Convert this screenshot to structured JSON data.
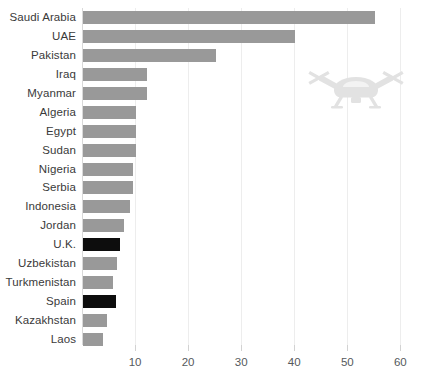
{
  "chart_data": {
    "type": "bar",
    "orientation": "horizontal",
    "title": "",
    "subtitle": "",
    "xlabel": "",
    "ylabel": "",
    "xlim": [
      0,
      62
    ],
    "ylim": null,
    "grid": true,
    "legend": null,
    "xticks": [
      10,
      20,
      30,
      40,
      50,
      60
    ],
    "categories": [
      "Saudi Arabia",
      "UAE",
      "Pakistan",
      "Iraq",
      "Myanmar",
      "Algeria",
      "Egypt",
      "Sudan",
      "Nigeria",
      "Serbia",
      "Indonesia",
      "Jordan",
      "U.K.",
      "Uzbekistan",
      "Turkmenistan",
      "Spain",
      "Kazakhstan",
      "Laos"
    ],
    "values": [
      55,
      40,
      25,
      12,
      12,
      10,
      10,
      10,
      9.5,
      9.5,
      8.8,
      7.8,
      7,
      6.4,
      5.7,
      6.2,
      4.6,
      3.8
    ],
    "highlighted": [
      "U.K.",
      "Spain"
    ],
    "colors": {
      "bar": "#999999",
      "bar_highlight": "#0d0d0d",
      "gridline": "#ededed",
      "axis": "#d9d9d9",
      "label_text": "#3a3a3a",
      "tick_text": "#55595c",
      "watermark": "#e2e2e2",
      "background": "#ffffff"
    },
    "annotations": [
      {
        "name": "drone-watermark",
        "icon": "drone-icon",
        "x_value": 42,
        "y_category": "Iraq"
      }
    ]
  }
}
